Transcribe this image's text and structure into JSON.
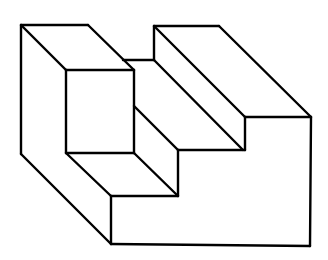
{
  "figure": {
    "title": "",
    "stroke_color": "#000000",
    "background_color": "#ffffff",
    "lines": [
      [
        21,
        25,
        88,
        25
      ],
      [
        88,
        25,
        134,
        70
      ],
      [
        21,
        25,
        66,
        70
      ],
      [
        66,
        70,
        134,
        70
      ],
      [
        21,
        25,
        21,
        154
      ],
      [
        21,
        154,
        111,
        244
      ],
      [
        66,
        70,
        66,
        153
      ],
      [
        134,
        70,
        134,
        153
      ],
      [
        66,
        153,
        134,
        153
      ],
      [
        66,
        153,
        111,
        196
      ],
      [
        111,
        196,
        111,
        244
      ],
      [
        111,
        196,
        178,
        196
      ],
      [
        134,
        153,
        178,
        196
      ],
      [
        134,
        106,
        178,
        150
      ],
      [
        178,
        150,
        178,
        196
      ],
      [
        123,
        60,
        154,
        60
      ],
      [
        154,
        26,
        154,
        60
      ],
      [
        154,
        26,
        219,
        26
      ],
      [
        154,
        26,
        245,
        117
      ],
      [
        154,
        60,
        243,
        150
      ],
      [
        219,
        26,
        311,
        117
      ],
      [
        245,
        117,
        311,
        117
      ],
      [
        245,
        117,
        245,
        150
      ],
      [
        178,
        150,
        245,
        150
      ],
      [
        311,
        117,
        310,
        246
      ],
      [
        111,
        244,
        310,
        246
      ]
    ]
  }
}
